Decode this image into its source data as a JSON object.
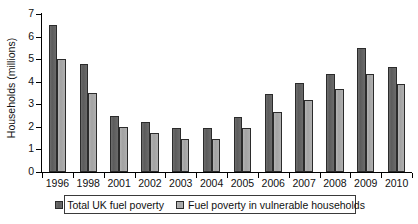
{
  "chart_data": {
    "type": "bar",
    "title": "",
    "subtitle": "",
    "xlabel": "",
    "ylabel": "Households (millions)",
    "categories": [
      "1996",
      "1998",
      "2001",
      "2002",
      "2003",
      "2004",
      "2005",
      "2006",
      "2007",
      "2008",
      "2009",
      "2010"
    ],
    "series": [
      {
        "name": "Total UK fuel poverty",
        "color": "#636363",
        "values": [
          6.5,
          4.8,
          2.5,
          2.2,
          1.95,
          1.95,
          2.45,
          3.45,
          3.95,
          4.35,
          5.5,
          4.65
        ]
      },
      {
        "name": "Fuel poverty in vulnerable households",
        "color": "#aaaaaa",
        "values": [
          5.0,
          3.5,
          2.0,
          1.75,
          1.45,
          1.45,
          1.95,
          2.65,
          3.2,
          3.7,
          4.35,
          3.9
        ]
      }
    ],
    "ylim": [
      0,
      7
    ],
    "yticks": [
      0,
      1,
      2,
      3,
      4,
      5,
      6,
      7
    ],
    "ytick_labels": [
      "0",
      "1",
      "2",
      "3",
      "4",
      "5",
      "6",
      "7"
    ],
    "grid": false,
    "legend_position": "bottom"
  }
}
